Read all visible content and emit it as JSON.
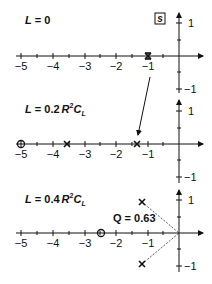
{
  "figure": {
    "plane_label": "s",
    "panels": [
      {
        "title": "L = 0",
        "title_parts": {
          "var": "L",
          "eq": " = ",
          "value": "0",
          "suffix": ""
        },
        "poles": [
          -1,
          -1
        ],
        "zeros": [],
        "note": "double pole at -1"
      },
      {
        "title": "L = 0.2 R²C_L",
        "title_parts": {
          "var": "L",
          "eq": " = ",
          "value": "0.2",
          "suffix": "R",
          "sup": "2",
          "c": "C",
          "sub": "L"
        },
        "poles": [
          -3.6,
          -1.35
        ],
        "zeros": [
          -5
        ]
      },
      {
        "title": "L = 0.4 R²C_L",
        "title_parts": {
          "var": "L",
          "eq": " = ",
          "value": "0.4",
          "suffix": "R",
          "sup": "2",
          "c": "C",
          "sub": "L"
        },
        "poles": [
          "-1.25+0.95j",
          "-1.25-0.95j"
        ],
        "zeros": [
          -2.5
        ],
        "annotation": "Q = 0.63"
      }
    ],
    "x_ticks": [
      "−5",
      "−4",
      "−3",
      "−2",
      "−1"
    ],
    "y_ticks": [
      "1",
      "−1"
    ]
  }
}
